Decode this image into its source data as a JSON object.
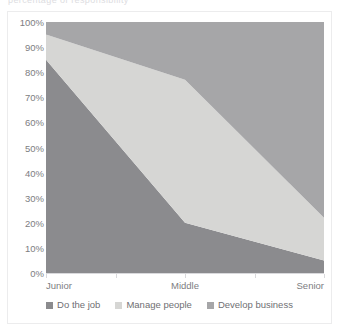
{
  "figure": {
    "clipped_title": "percentage of responsibility",
    "border_color": "#ececed",
    "background": "#ffffff"
  },
  "axis": {
    "y_ticks": [
      "100%",
      "90%",
      "80%",
      "70%",
      "60%",
      "50%",
      "40%",
      "30%",
      "20%",
      "10%",
      "0%"
    ],
    "x_ticks": [
      "Junior",
      "Middle",
      "Senior"
    ],
    "axis_line_color": "#d9d9dc",
    "tick_label_color": "#7d7d81"
  },
  "legend": {
    "items": [
      {
        "label": "Do the job",
        "color": "#8b8b8e",
        "swatch": "legend-swatch-do-the-job"
      },
      {
        "label": "Manage people",
        "color": "#d6d6d4",
        "swatch": "legend-swatch-manage-people"
      },
      {
        "label": "Develop business",
        "color": "#a6a6a8",
        "swatch": "legend-swatch-develop-business"
      }
    ],
    "text_color": "#6f6f73"
  },
  "chart_data": {
    "type": "area",
    "stacked": true,
    "normalized_100_percent": true,
    "title": "",
    "subtitle": "",
    "xlabel": "",
    "ylabel": "",
    "categories": [
      "Junior",
      "Middle",
      "Senior"
    ],
    "ylim": [
      0,
      100
    ],
    "y_tick_step": 10,
    "y_tick_format": "percent",
    "grid": false,
    "legend_position": "bottom",
    "series": [
      {
        "name": "Do the job",
        "values": [
          85,
          20,
          5
        ],
        "color": "#8b8b8e",
        "stack_order": 1
      },
      {
        "name": "Manage people",
        "values": [
          10,
          57,
          17
        ],
        "color": "#d6d6d4",
        "stack_order": 2
      },
      {
        "name": "Develop business",
        "values": [
          5,
          23,
          78
        ],
        "color": "#a6a6a8",
        "stack_order": 3
      }
    ],
    "cumulative_upper_bounds": {
      "do_the_job": [
        85,
        20,
        5
      ],
      "manage_people": [
        95,
        77,
        22
      ],
      "develop_business": [
        100,
        100,
        100
      ]
    },
    "annotations": []
  }
}
